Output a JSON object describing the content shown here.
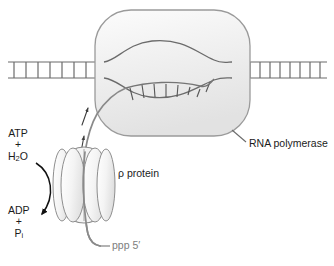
{
  "figure": {
    "background_color": "#ffffff"
  },
  "colors": {
    "dna_stroke": "#6b6b6b",
    "rna_stroke": "#8a8a8a",
    "polymerase_fill_light": "#fbfbfb",
    "polymerase_fill_dark": "#e6e6e6",
    "polymerase_stroke": "#9a9a9a",
    "rho_fill": "#f2f2f2",
    "rho_stroke": "#8e8e8e",
    "text_dark": "#1b1b1b",
    "text_gray": "#7d7d7d",
    "arrow_black": "#111111",
    "leader_line": "#6b6b6b"
  },
  "labels": {
    "rna_polymerase": "RNA polymerase",
    "rho_protein": "ρ protein",
    "rna_five_prime": "ppp 5′",
    "substrate": {
      "line1": "ATP",
      "plus": "+",
      "line3_main": "H",
      "line3_sub": "2",
      "line3_tail": "O"
    },
    "product": {
      "line1": "ADP",
      "plus": "+",
      "line3_main": "P",
      "line3_sub": "i"
    }
  },
  "structures": {
    "dna": {
      "description": "double-stranded DNA drawn as a ladder",
      "left_rungs": 8,
      "right_rungs": 10,
      "strand_y_top": 62,
      "strand_y_bottom": 78
    },
    "transcription_bubble": {
      "description": "melted DNA inside polymerase with RNA-DNA hybrid",
      "hybrid_rungs": 8
    },
    "rna_polymerase": {
      "shape": "rounded-rectangle",
      "x": 95,
      "y": 10,
      "width": 155,
      "height": 126
    },
    "rho_protein": {
      "shape": "hexameric ring of lobes",
      "subunit_lobes": 6,
      "cx": 84,
      "cy": 185
    },
    "movement_arrows": {
      "count": 2,
      "direction": "up along RNA toward polymerase"
    },
    "atp_hydrolysis_arrow": {
      "direction": "curved, ATP+H2O down to ADP+Pi"
    }
  }
}
